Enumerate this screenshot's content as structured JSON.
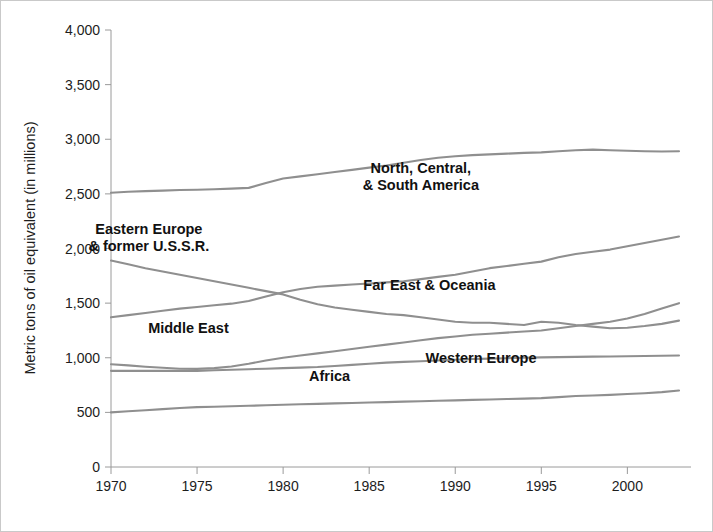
{
  "chart_data": {
    "type": "line",
    "title": "",
    "xlabel": "",
    "ylabel": "Metric tons of oil equivalent (in millions)",
    "xlim": [
      1970,
      2003
    ],
    "ylim": [
      0,
      4000
    ],
    "grid": false,
    "legend_position": "inline-labels",
    "line_color": "#8f8f8f",
    "label_color": "#111111",
    "axis_color": "#9a9a9a",
    "xticks": [
      1970,
      1975,
      1980,
      1985,
      1990,
      1995,
      2000
    ],
    "xtick_labels": [
      "1970",
      "1975",
      "1980",
      "1985",
      "1990",
      "1995",
      "2000"
    ],
    "yticks": [
      0,
      500,
      1000,
      1500,
      2000,
      2500,
      3000,
      3500,
      4000
    ],
    "ytick_labels": [
      "0",
      "500",
      "1,000",
      "1,500",
      "2,000",
      "2,500",
      "3,000",
      "3,500",
      "4,000"
    ],
    "x": [
      1970,
      1971,
      1972,
      1973,
      1974,
      1975,
      1976,
      1977,
      1978,
      1979,
      1980,
      1981,
      1982,
      1983,
      1984,
      1985,
      1986,
      1987,
      1988,
      1989,
      1990,
      1991,
      1992,
      1993,
      1994,
      1995,
      1996,
      1997,
      1998,
      1999,
      2000,
      2001,
      2002,
      2003
    ],
    "series": [
      {
        "name": "North, Central, & South America",
        "label": "North, Central,\n& South America",
        "label_line1": "North, Central,",
        "label_line2": "& South America",
        "values": [
          2510,
          2520,
          2525,
          2530,
          2535,
          2538,
          2542,
          2548,
          2555,
          2600,
          2640,
          2660,
          2680,
          2700,
          2720,
          2740,
          2760,
          2785,
          2810,
          2830,
          2845,
          2855,
          2862,
          2868,
          2875,
          2880,
          2890,
          2900,
          2905,
          2900,
          2895,
          2890,
          2888,
          2890
        ]
      },
      {
        "name": "Eastern Europe & former U.S.S.R.",
        "label": "Eastern Europe\n& former U.S.S.R.",
        "label_line1": "Eastern Europe",
        "label_line2": "& former U.S.S.R.",
        "values": [
          1890,
          1855,
          1820,
          1790,
          1760,
          1730,
          1700,
          1670,
          1640,
          1610,
          1580,
          1530,
          1490,
          1460,
          1440,
          1420,
          1400,
          1390,
          1370,
          1350,
          1330,
          1320,
          1320,
          1310,
          1300,
          1330,
          1320,
          1300,
          1285,
          1270,
          1275,
          1290,
          1310,
          1340
        ]
      },
      {
        "name": "Far East & Oceania",
        "label": "Far East & Oceania",
        "label_line1": "Far East & Oceania",
        "values": [
          1370,
          1390,
          1410,
          1430,
          1450,
          1465,
          1480,
          1495,
          1520,
          1560,
          1600,
          1630,
          1650,
          1660,
          1670,
          1680,
          1690,
          1700,
          1720,
          1740,
          1760,
          1790,
          1820,
          1840,
          1860,
          1880,
          1920,
          1950,
          1970,
          1990,
          2020,
          2050,
          2080,
          2110
        ]
      },
      {
        "name": "Middle East",
        "label": "Middle East",
        "label_line1": "Middle East",
        "values": [
          880,
          880,
          880,
          880,
          880,
          880,
          885,
          890,
          895,
          900,
          905,
          910,
          915,
          925,
          935,
          945,
          955,
          962,
          968,
          975,
          982,
          988,
          992,
          996,
          1000,
          1003,
          1006,
          1008,
          1010,
          1012,
          1014,
          1016,
          1018,
          1020
        ]
      },
      {
        "name": "Western Europe",
        "label": "Western Europe",
        "label_line1": "Western Europe",
        "values": [
          940,
          930,
          918,
          908,
          900,
          898,
          905,
          920,
          945,
          975,
          1000,
          1020,
          1040,
          1060,
          1080,
          1100,
          1120,
          1140,
          1160,
          1180,
          1195,
          1210,
          1220,
          1230,
          1240,
          1250,
          1270,
          1290,
          1310,
          1330,
          1360,
          1400,
          1450,
          1500
        ]
      },
      {
        "name": "Africa",
        "label": "Africa",
        "label_line1": "Africa",
        "values": [
          500,
          510,
          520,
          530,
          540,
          548,
          552,
          556,
          560,
          565,
          570,
          574,
          578,
          582,
          586,
          590,
          594,
          598,
          602,
          606,
          610,
          614,
          618,
          622,
          626,
          630,
          640,
          650,
          655,
          660,
          668,
          675,
          685,
          700
        ]
      }
    ]
  },
  "series_label_positions": [
    {
      "name": "americas",
      "x": 1988,
      "y": 2690,
      "lines": 2
    },
    {
      "name": "eastern-europe",
      "x": 1972.2,
      "y": 2130,
      "lines": 2
    },
    {
      "name": "far-east",
      "x": 1988.5,
      "y": 1620,
      "lines": 1
    },
    {
      "name": "middle-east",
      "x": 1974.5,
      "y": 1225,
      "lines": 1
    },
    {
      "name": "western-europe",
      "x": 1991.5,
      "y": 950,
      "lines": 1
    },
    {
      "name": "africa",
      "x": 1982.7,
      "y": 790,
      "lines": 1
    }
  ]
}
